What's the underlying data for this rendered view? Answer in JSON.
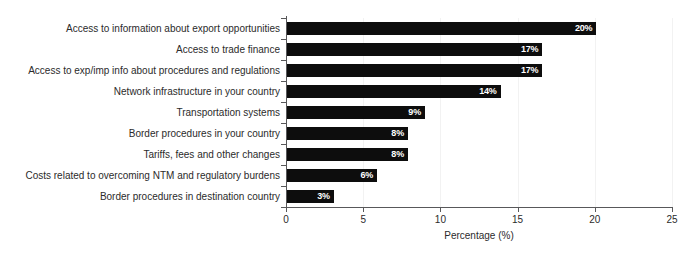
{
  "chart_data": {
    "type": "bar",
    "orientation": "horizontal",
    "title": "",
    "xlabel": "Percentage (%)",
    "ylabel": "",
    "xlim": [
      0,
      25
    ],
    "xticks": [
      0,
      5,
      10,
      15,
      20,
      25
    ],
    "xticklabels": [
      "0",
      "5",
      "10",
      "15",
      "20",
      "25"
    ],
    "grid": true,
    "grid_axis": "x",
    "legend": false,
    "bar_color": "#0d0d0d",
    "value_label_color": "#ffffff",
    "value_label_suffix": "%",
    "categories": [
      "Access to information about export opportunities",
      "Access to trade finance",
      "Access to exp/imp info about procedures and regulations",
      "Network infrastructure in your country",
      "Transportation systems",
      "Border procedures in your country",
      "Tariffs, fees and other changes",
      "Costs related to overcoming NTM and regulatory burdens",
      "Border procedures in destination country"
    ],
    "values": [
      20,
      17,
      17,
      14,
      9,
      8,
      8,
      6,
      3
    ],
    "value_labels": [
      "20%",
      "17%",
      "17%",
      "14%",
      "9%",
      "8%",
      "8%",
      "6%",
      "3%"
    ],
    "bar_lengths": [
      20.1,
      16.6,
      16.6,
      13.9,
      9.0,
      7.9,
      7.9,
      5.9,
      3.1
    ]
  }
}
